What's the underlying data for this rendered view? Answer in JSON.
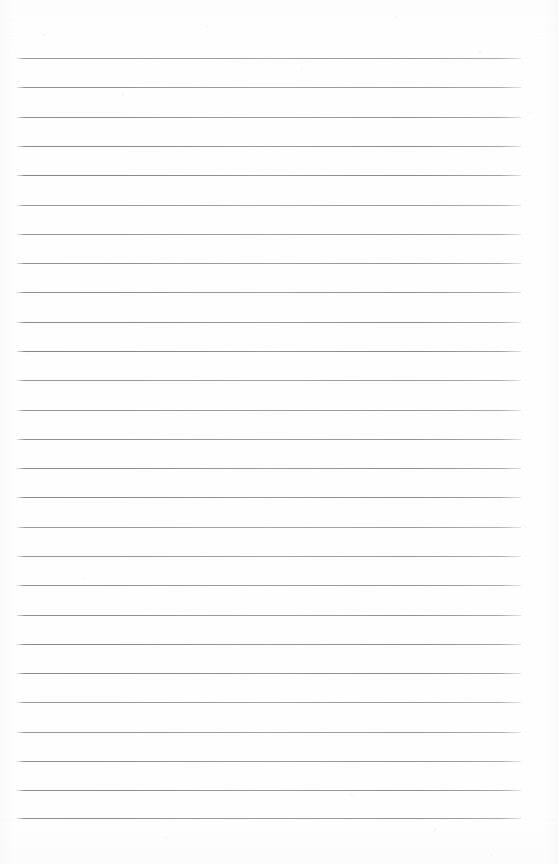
{
  "document": {
    "kind": "scanned-ruled-paper",
    "title": "Blank Ruled Notebook Page",
    "page_label": "",
    "header_text": "",
    "footer_text": "",
    "body_text": "",
    "background_color": "#fefefe",
    "rule_color": "#80808 6",
    "rule_color_hex": "#808086",
    "page_width": 558,
    "page_height": 864
  },
  "ruling": {
    "line_count": 27,
    "first_line_y": 58,
    "last_line_y": 818,
    "line_spacing": 29.3,
    "line_left_x": 17,
    "line_right_x": 521,
    "line_thickness": 1,
    "margin_line_present": false,
    "lines": [
      {
        "index": 1,
        "y": 58,
        "text": ""
      },
      {
        "index": 2,
        "y": 87,
        "text": ""
      },
      {
        "index": 3,
        "y": 117,
        "text": ""
      },
      {
        "index": 4,
        "y": 146,
        "text": ""
      },
      {
        "index": 5,
        "y": 175,
        "text": ""
      },
      {
        "index": 6,
        "y": 205,
        "text": ""
      },
      {
        "index": 7,
        "y": 234,
        "text": ""
      },
      {
        "index": 8,
        "y": 263,
        "text": ""
      },
      {
        "index": 9,
        "y": 292,
        "text": ""
      },
      {
        "index": 10,
        "y": 322,
        "text": ""
      },
      {
        "index": 11,
        "y": 351,
        "text": ""
      },
      {
        "index": 12,
        "y": 380,
        "text": ""
      },
      {
        "index": 13,
        "y": 410,
        "text": ""
      },
      {
        "index": 14,
        "y": 439,
        "text": ""
      },
      {
        "index": 15,
        "y": 468,
        "text": ""
      },
      {
        "index": 16,
        "y": 497,
        "text": ""
      },
      {
        "index": 17,
        "y": 527,
        "text": ""
      },
      {
        "index": 18,
        "y": 556,
        "text": ""
      },
      {
        "index": 19,
        "y": 585,
        "text": ""
      },
      {
        "index": 20,
        "y": 615,
        "text": ""
      },
      {
        "index": 21,
        "y": 644,
        "text": ""
      },
      {
        "index": 22,
        "y": 673,
        "text": ""
      },
      {
        "index": 23,
        "y": 702,
        "text": ""
      },
      {
        "index": 24,
        "y": 732,
        "text": ""
      },
      {
        "index": 25,
        "y": 761,
        "text": ""
      },
      {
        "index": 26,
        "y": 790,
        "text": ""
      },
      {
        "index": 27,
        "y": 818,
        "text": ""
      }
    ]
  }
}
